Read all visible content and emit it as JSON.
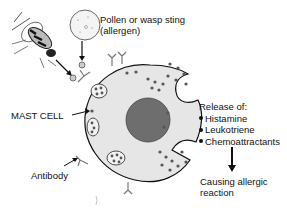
{
  "diagram": {
    "labels": {
      "allergen": [
        "Pollen or wasp sting",
        "(allergen)"
      ],
      "mast_cell": "MAST CELL",
      "antibody": "Antibody",
      "release_title": "Release of:",
      "mediators": [
        "Histamine",
        "Leukotriene",
        "Chemoattractants"
      ],
      "outcome": [
        "Causing allergic",
        "reaction"
      ]
    },
    "icons": {
      "wasp": "wasp-icon",
      "pollen": "pollen-grain-icon",
      "cell": "mast-cell-icon",
      "antibody": "antibody-y-icon"
    },
    "colors": {
      "ink": "#111111",
      "cell_fill": "#e6e6e6",
      "nucleus": "#6e6e6e",
      "granule": "#555555"
    }
  }
}
